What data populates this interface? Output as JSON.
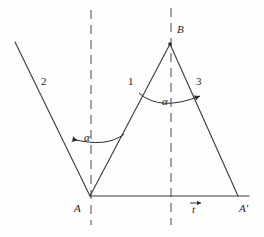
{
  "figure": {
    "background_color": "#fdfdfd",
    "stroke_color": "#3a3a3a",
    "text_color": "#1d1d1d",
    "width": 264,
    "height": 237
  },
  "labels": {
    "ray_incident": "2",
    "ray_left_side": "1",
    "ray_right_side": "3",
    "point_a": "A",
    "point_a_prime": "A'",
    "point_b": "B",
    "angle_left": "α",
    "angle_right": "α",
    "translation_vector": "t"
  },
  "geometry": {
    "point_a": [
      90,
      196
    ],
    "point_a_prime": [
      238,
      196
    ],
    "point_b": [
      170,
      44
    ],
    "ray2_start": [
      15,
      42
    ],
    "baseline_y": 196,
    "dashed_line_left_x": 91,
    "dashed_line_right_x": 171,
    "dashed_line_top_y": 10,
    "dashed_line_bottom_y": 225
  },
  "label_positions": {
    "ray_incident": [
      44,
      82
    ],
    "ray_left_side": [
      130,
      82
    ],
    "ray_right_side": [
      196,
      82
    ],
    "point_a": [
      74,
      204
    ],
    "point_a_prime": [
      240,
      204
    ],
    "point_b": [
      177,
      25
    ],
    "angle_left": [
      85,
      133
    ],
    "angle_right": [
      163,
      97
    ],
    "translation_vector": [
      192,
      202
    ]
  }
}
